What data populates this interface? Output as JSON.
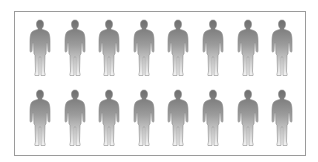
{
  "graphic": {
    "description": "Two rows of eight standing person silhouettes inside a rectangular frame",
    "rows": 2,
    "figures_per_row": 8,
    "total_figures": 16,
    "figure_icon": "person-silhouette-icon",
    "colors": {
      "frame_border": "#9a9a9a",
      "background": "#ffffff",
      "figure_top": "#6e6e6e",
      "figure_bottom": "#f2f2f2",
      "figure_outline": "#8a8a8a"
    }
  }
}
